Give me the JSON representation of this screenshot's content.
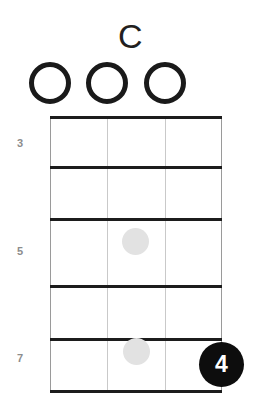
{
  "diagram": {
    "chord_name": "C",
    "instrument_strings": 4,
    "displayed_frets": 5,
    "colors": {
      "line": "#1c1c1c",
      "string": "#c9c9c9",
      "ghost_dot": "#e2e2e2",
      "finger_marker": "#0d0d0d",
      "finger_text": "#ffffff",
      "fret_label": "#8c8c8c",
      "title": "#231f20",
      "background": "#ffffff"
    }
  },
  "open_strings": [
    {
      "name": "open-string-1",
      "label": "O",
      "x": 50
    },
    {
      "name": "open-string-2",
      "label": "O",
      "x": 107
    },
    {
      "name": "open-string-3",
      "label": "O",
      "x": 165
    }
  ],
  "fret_numbers": [
    {
      "label": "3",
      "y": 137
    },
    {
      "label": "5",
      "y": 245
    },
    {
      "label": "7",
      "y": 352
    }
  ],
  "fret_lines_y": [
    0,
    50,
    102,
    169,
    222,
    274
  ],
  "string_lines_x": [
    0,
    57,
    115,
    171
  ],
  "ghost_dots": [
    {
      "name": "ghost-dot-fret-5",
      "x": 85,
      "y": 125
    },
    {
      "name": "ghost-dot-fret-7",
      "x": 86,
      "y": 235
    }
  ],
  "finger_markers": [
    {
      "name": "finger-marker-4",
      "label": "4",
      "x": 171,
      "y": 248
    }
  ],
  "chart_data": {
    "type": "table",
    "title": "C",
    "xlabel": "Strings",
    "ylabel": "Frets",
    "categories": [
      "String 1",
      "String 2",
      "String 3",
      "String 4"
    ],
    "fret_range": [
      3,
      7
    ],
    "fret_tick_labels": [
      "3",
      "5",
      "7"
    ],
    "open_string_markers": [
      "O",
      "O",
      "O",
      ""
    ],
    "series": [
      {
        "name": "Ghost positions",
        "points": [
          {
            "string": 2,
            "fret": 5
          },
          {
            "string": 2,
            "fret": 7
          }
        ]
      },
      {
        "name": "Fretted finger",
        "points": [
          {
            "string": 4,
            "fret": 7,
            "finger": 4
          }
        ]
      }
    ],
    "grid": true,
    "legend": "none"
  }
}
